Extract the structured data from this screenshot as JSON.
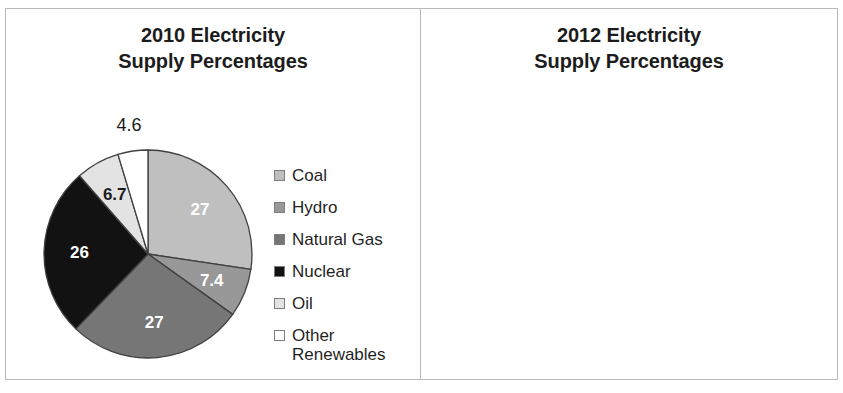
{
  "colors": {
    "coal": "#bfbfbf",
    "hydro": "#989898",
    "natural_gas": "#767676",
    "nuclear": "#121212",
    "oil": "#e3e3e3",
    "other_renewables": "#ffffff",
    "slice_outline": "#404040",
    "panel_border": "#b9b9b9",
    "text": "#1c1c1c"
  },
  "legend": {
    "items": [
      {
        "label": "Coal",
        "key": "coal"
      },
      {
        "label": "Hydro",
        "key": "hydro"
      },
      {
        "label": "Natural Gas",
        "key": "natural_gas"
      },
      {
        "label": "Nuclear",
        "key": "nuclear"
      },
      {
        "label": "Oil",
        "key": "oil"
      },
      {
        "label": "Other\nRenewables",
        "key": "other_renewables"
      }
    ]
  },
  "panels": [
    {
      "id": "panel-2010",
      "title": "2010 Electricity\nSupply Percentages"
    },
    {
      "id": "panel-2012",
      "title": "2012 Electricity\nSupply Percentages"
    }
  ],
  "chart_data": [
    {
      "type": "pie",
      "title": "2010 Electricity Supply Percentages",
      "year": "2010",
      "categories": [
        "Coal",
        "Hydro",
        "Natural Gas",
        "Nuclear",
        "Oil",
        "Other Renewables"
      ],
      "values": [
        27,
        7.4,
        27,
        26,
        6.7,
        4.6
      ],
      "labels": [
        "27",
        "7.4",
        "27",
        "26",
        "6.7",
        "4.6"
      ],
      "label_placement": [
        "inside",
        "inside",
        "inside",
        "inside",
        "inside",
        "outside"
      ],
      "label_color": [
        "light",
        "light",
        "light",
        "light",
        "dark",
        "dark"
      ],
      "colors": [
        "#bfbfbf",
        "#989898",
        "#767676",
        "#121212",
        "#e3e3e3",
        "#ffffff"
      ],
      "start_angle_deg": 0,
      "direction": "clockwise",
      "legend_position": "right",
      "grid": false
    },
    {
      "type": "pie",
      "title": "2012 Electricity Supply Percentages",
      "year": "2012",
      "categories": [
        "Coal",
        "Hydro",
        "Natural Gas",
        "Nuclear",
        "Oil",
        "Other Renewables"
      ],
      "values": [
        29.3,
        8.1,
        38.4,
        1.5,
        17.5,
        5.1
      ],
      "labels": [
        "29.3",
        "8.1",
        "38.4",
        "1.5",
        "17.5",
        "5.1"
      ],
      "label_placement": [
        "inside",
        "inside",
        "inside",
        "outside",
        "inside",
        "outside"
      ],
      "label_color": [
        "light",
        "light",
        "light",
        "dark",
        "dark",
        "dark"
      ],
      "colors": [
        "#bfbfbf",
        "#989898",
        "#767676",
        "#121212",
        "#e3e3e3",
        "#ffffff"
      ],
      "start_angle_deg": 0,
      "direction": "clockwise",
      "legend_position": "right",
      "grid": false
    }
  ]
}
